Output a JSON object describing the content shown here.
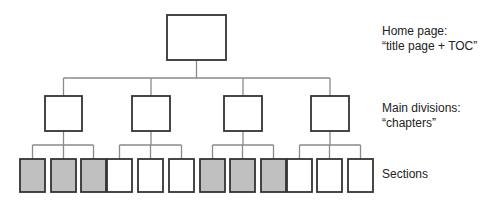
{
  "diagram": {
    "type": "hierarchy-tree",
    "colors": {
      "line": "#8a8a8a",
      "box_border": "#333333",
      "shaded_fill": "#c0c0c0",
      "plain_fill": "#ffffff"
    },
    "levels": [
      {
        "name": "home",
        "label_line1": "Home page:",
        "label_line2": "“title page + TOC”"
      },
      {
        "name": "chapters",
        "label_line1": "Main divisions:",
        "label_line2": "“chapters”"
      },
      {
        "name": "sections",
        "label_line1": "Sections"
      }
    ],
    "home_node": {
      "x": 167,
      "y": 15,
      "w": 59,
      "h": 45
    },
    "chapter_nodes": [
      {
        "x": 45,
        "y": 96,
        "w": 37,
        "h": 35
      },
      {
        "x": 132,
        "y": 96,
        "w": 38,
        "h": 35
      },
      {
        "x": 224,
        "y": 96,
        "w": 38,
        "h": 35
      },
      {
        "x": 311,
        "y": 96,
        "w": 38,
        "h": 35
      }
    ],
    "section_nodes": [
      {
        "x": 20,
        "shaded": true,
        "parent": 0
      },
      {
        "x": 51,
        "shaded": true,
        "parent": 0
      },
      {
        "x": 81,
        "shaded": true,
        "parent": 0
      },
      {
        "x": 107,
        "shaded": false,
        "parent": 1
      },
      {
        "x": 138,
        "shaded": false,
        "parent": 1
      },
      {
        "x": 169,
        "shaded": false,
        "parent": 1
      },
      {
        "x": 200,
        "shaded": true,
        "parent": 2
      },
      {
        "x": 230,
        "shaded": true,
        "parent": 2
      },
      {
        "x": 261,
        "shaded": true,
        "parent": 2
      },
      {
        "x": 287,
        "shaded": false,
        "parent": 3
      },
      {
        "x": 317,
        "shaded": false,
        "parent": 3
      },
      {
        "x": 348,
        "shaded": false,
        "parent": 3
      }
    ]
  }
}
